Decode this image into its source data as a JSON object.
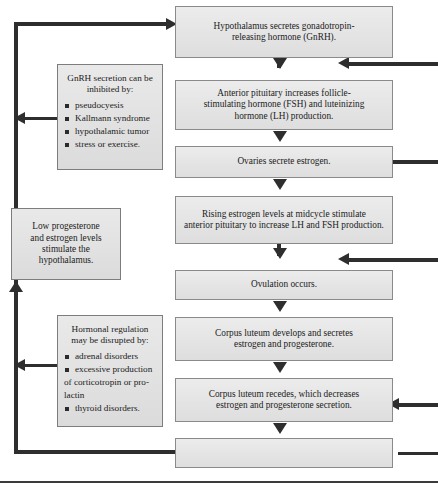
{
  "diagram": {
    "colors": {
      "box_fill": "#e6e6e6",
      "box_border": "#8a8a8a",
      "connector": "#2e2e2e",
      "text": "#1b1b1b",
      "page_background": "#ffffff"
    }
  },
  "flow_steps": [
    {
      "id": "hypothalamus",
      "lines": [
        "Hypothalamus secretes gonadotropin-",
        "releasing hormone (GnRH)."
      ]
    },
    {
      "id": "anterior-pituitary",
      "lines": [
        "Anterior pituitary increases follicle-",
        "stimulating hormone (FSH) and luteinizing",
        "hormone (LH) production."
      ]
    },
    {
      "id": "ovaries-estrogen",
      "lines": [
        "Ovaries secrete estrogen."
      ]
    },
    {
      "id": "rising-estrogen",
      "lines": [
        "Rising estrogen levels at midcycle stimulate",
        "anterior pituitary to increase LH and FSH production."
      ]
    },
    {
      "id": "ovulation",
      "lines": [
        "Ovulation occurs."
      ]
    },
    {
      "id": "corpus-luteum-develops",
      "lines": [
        "Corpus luteum develops and secretes",
        "estrogen and progesterone."
      ]
    },
    {
      "id": "corpus-luteum-recedes",
      "lines": [
        "Corpus luteum recedes, which decreases",
        "estrogen and progesterone secretion."
      ]
    },
    {
      "id": "final-step",
      "lines": [
        ""
      ]
    }
  ],
  "notes": {
    "gnrh_inhibition": {
      "heading_lines": [
        "GnRH secretion can be",
        "inhibited by:"
      ],
      "items": [
        "pseudocyesis",
        "Kallmann syndrome",
        "hypothalamic tumor",
        "stress or exercise."
      ]
    },
    "low_progesterone": {
      "lines": [
        "Low progesterone",
        "and estrogen levels",
        "stimulate the",
        "hypothalamus."
      ]
    },
    "hormonal_disruption": {
      "heading_lines": [
        "Hormonal regulation",
        "may be disrupted by:"
      ],
      "items": [
        {
          "text": "adrenal disorders",
          "bullet": true
        },
        {
          "text": "excessive production",
          "bullet": true
        },
        {
          "text": "of corticotropin or pro-",
          "bullet": false
        },
        {
          "text": "lactin",
          "bullet": false
        },
        {
          "text": "thyroid disorders.",
          "bullet": true
        }
      ]
    }
  }
}
